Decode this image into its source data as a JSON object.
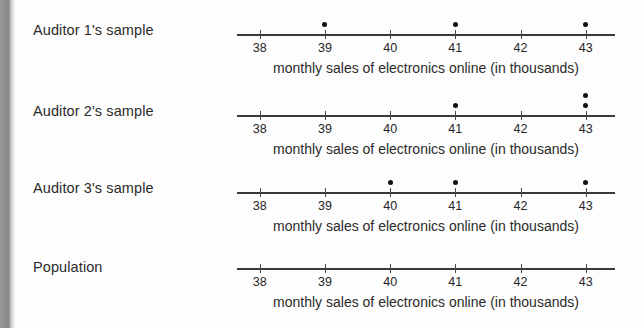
{
  "chart_data": {
    "type": "scatter",
    "title": "",
    "xlabel": "monthly sales of electronics online (in thousands)",
    "ylabel": "",
    "xlim": [
      37.65,
      43.45
    ],
    "xticks": [
      38,
      39,
      40,
      41,
      42,
      43
    ],
    "xticklabels": [
      "38",
      "39",
      "40",
      "41",
      "42",
      "43"
    ],
    "grid": false,
    "legend": false,
    "plot_style": "dotplot-number-line",
    "panels": [
      {
        "label": "Auditor 1's sample",
        "caption": "monthly sales of electronics online (in thousands)",
        "values": [
          39,
          41,
          43
        ],
        "stacks": [
          {
            "x": 39,
            "count": 1
          },
          {
            "x": 41,
            "count": 1
          },
          {
            "x": 43,
            "count": 1
          }
        ]
      },
      {
        "label": "Auditor 2's sample",
        "caption": "monthly sales of electronics online (in thousands)",
        "values": [
          41,
          43,
          43
        ],
        "stacks": [
          {
            "x": 41,
            "count": 1
          },
          {
            "x": 43,
            "count": 2
          }
        ]
      },
      {
        "label": "Auditor 3's sample",
        "caption": "monthly sales of electronics online (in thousands)",
        "values": [
          40,
          41,
          43
        ],
        "stacks": [
          {
            "x": 40,
            "count": 1
          },
          {
            "x": 41,
            "count": 1
          },
          {
            "x": 43,
            "count": 1
          }
        ]
      },
      {
        "label": "Population",
        "caption": "monthly sales of electronics online (in thousands)",
        "values": [],
        "stacks": []
      }
    ]
  },
  "colors": {
    "background": "#fdfdfd",
    "text": "#2b2b2b",
    "axis": "#3a3a3a",
    "dot": "#111111",
    "spine": "#8e8e8e"
  }
}
